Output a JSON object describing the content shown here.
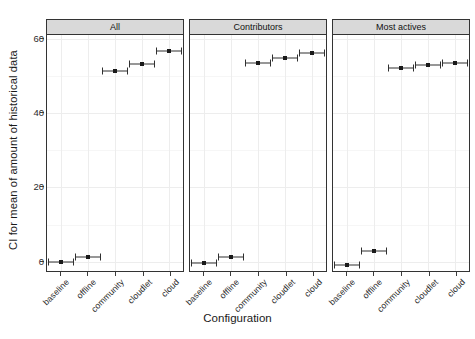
{
  "chart_data": {
    "type": "scatter",
    "title": "",
    "xlabel": "Configuration",
    "ylabel": "CI for mean of amount of historical data",
    "ylim": [
      -3,
      61
    ],
    "yticks": [
      0,
      20,
      40,
      60
    ],
    "ytick_labels": [
      "0",
      "20",
      "40",
      "60"
    ],
    "grid": true,
    "legend": "none",
    "facet_orientation": "horizontal",
    "categories": [
      "baseline",
      "offline",
      "community",
      "cloudlet",
      "cloud"
    ],
    "marker_style": "point-with-horizontal-confidence-interval",
    "panels": [
      {
        "label": "All",
        "values": [
          0.0,
          1.2,
          51.3,
          53.2,
          56.7
        ],
        "ci_low": [
          -0.6,
          0.5,
          50.6,
          52.5,
          56.0
        ],
        "ci_high": [
          0.6,
          1.9,
          52.0,
          53.9,
          57.4
        ]
      },
      {
        "label": "Contributors",
        "values": [
          -0.4,
          1.3,
          53.4,
          54.8,
          56.2
        ],
        "ci_low": [
          -1.1,
          0.6,
          52.7,
          54.1,
          55.5
        ],
        "ci_high": [
          0.3,
          2.0,
          54.1,
          55.5,
          56.9
        ]
      },
      {
        "label": "Most actives",
        "values": [
          -0.9,
          2.9,
          52.1,
          52.8,
          53.4
        ],
        "ci_low": [
          -1.7,
          2.2,
          51.3,
          52.0,
          52.6
        ],
        "ci_high": [
          -0.1,
          3.6,
          52.9,
          53.6,
          54.2
        ]
      }
    ],
    "colors": {
      "point": "#1a1a1a",
      "errorbar": "#303030",
      "panel_border": "#333333",
      "strip_background": "#d9d9d9",
      "grid_major": "#ededed",
      "grid_minor": "#f6f6f6",
      "background": "#ffffff",
      "text": "#1a1a1a"
    }
  }
}
